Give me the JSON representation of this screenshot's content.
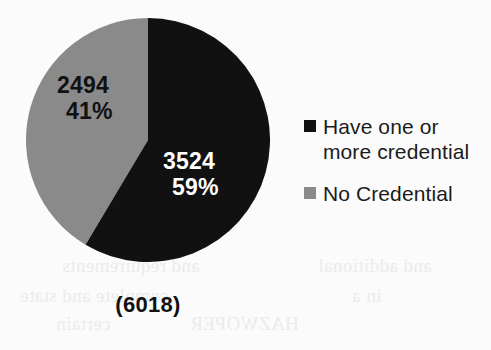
{
  "chart_data": {
    "type": "pie",
    "title": "",
    "subtitle": "",
    "xlabel": "",
    "ylabel": "",
    "categories": [
      "Have one or more credential",
      "No Credential"
    ],
    "values": [
      3524,
      2494
    ],
    "percents": [
      "59%",
      "41%"
    ],
    "value_labels": [
      "3524",
      "2494"
    ],
    "colors": [
      "#111111",
      "#8a8a8a"
    ],
    "label_text_colors": [
      "#ffffff",
      "#111111"
    ],
    "total": 6018,
    "total_label": "(6018)",
    "legend_position": "right",
    "grid": false,
    "start_angle_deg": 0,
    "direction": "clockwise",
    "slices": [
      {
        "name": "Have one or more credential",
        "value": 3524,
        "percent": 59,
        "percent_label": "59%",
        "value_label": "3524",
        "color": "#111111",
        "label_color": "#ffffff"
      },
      {
        "name": "No Credential",
        "value": 2494,
        "percent": 41,
        "percent_label": "41%",
        "value_label": "2494",
        "color": "#8a8a8a",
        "label_color": "#111111"
      }
    ]
  },
  "legend": {
    "items": [
      {
        "label": "Have one or more credential",
        "swatch_color": "#111111",
        "swatch_icon": "filled-square-icon"
      },
      {
        "label": "No Credential",
        "swatch_color": "#8a8a8a",
        "swatch_icon": "filled-square-icon"
      }
    ]
  },
  "labels": {
    "gray_value": "2494",
    "gray_percent": "41%",
    "black_value": "3524",
    "black_percent": "59%",
    "total": "(6018)"
  },
  "background": {
    "page_color": "#fbfbfb",
    "ghost_text": [
      {
        "text": "and requirements",
        "x": 62,
        "y": 262
      },
      {
        "text": "and additional",
        "x": 330,
        "y": 262
      },
      {
        "text": "complete and state",
        "x": 24,
        "y": 292
      },
      {
        "text": "in a",
        "x": 356,
        "y": 292
      },
      {
        "text": "certain",
        "x": 60,
        "y": 320
      },
      {
        "text": "HAZWOPER",
        "x": 196,
        "y": 320
      }
    ]
  }
}
